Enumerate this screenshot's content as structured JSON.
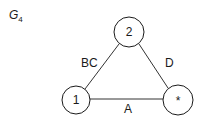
{
  "graph": {
    "title": "G",
    "title_subscript": "4",
    "nodes": [
      {
        "id": "2",
        "label": "2",
        "cx": 129,
        "cy": 32,
        "r": 15
      },
      {
        "id": "1",
        "label": "1",
        "cx": 76,
        "cy": 100,
        "r": 14
      },
      {
        "id": "star",
        "label": "*",
        "cx": 178,
        "cy": 100,
        "r": 15
      }
    ],
    "edges": [
      {
        "from": "1",
        "to": "2",
        "label": "BC"
      },
      {
        "from": "2",
        "to": "star",
        "label": "D"
      },
      {
        "from": "1",
        "to": "star",
        "label": "A"
      }
    ]
  }
}
